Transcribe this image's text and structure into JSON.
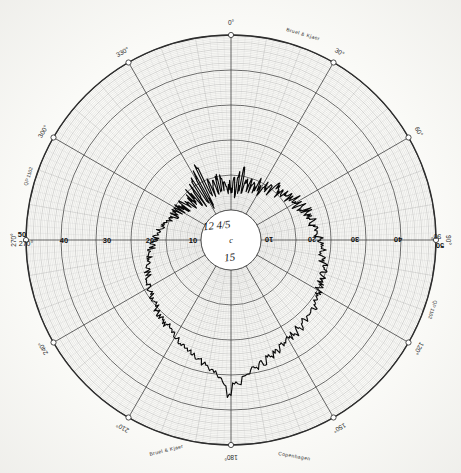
{
  "document": {
    "kind": "polar-recording-chart",
    "brand_top": "Bruel & Kjaer",
    "brand_bottom": "Bruel & Kjaer",
    "brand_bottom_right": "Copenhagen",
    "paper_code_left": "QP 1102",
    "paper_code_right": "QP 1102"
  },
  "annotations": {
    "center_top": "12  4/5",
    "center_mid": "c",
    "center_bottom": "15"
  },
  "axis": {
    "radial_unit": "dB",
    "left_labels": [
      "50",
      "40",
      "30",
      "20",
      "10",
      "0"
    ],
    "right_labels": [
      "0",
      "10",
      "20",
      "30",
      "40",
      "50"
    ],
    "left_origin_angle_label": "270°",
    "right_origin_angle_label": "90°",
    "db_range": [
      0,
      50
    ],
    "db_major_step": 10,
    "db_minor_step": 2
  },
  "angles": {
    "labels": [
      "0°",
      "30°",
      "60°",
      "90°",
      "120°",
      "150°",
      "180°",
      "210°",
      "240°",
      "270°",
      "300°",
      "330°"
    ],
    "step_deg": 30,
    "minor_step_deg": 10
  },
  "chart_data": {
    "type": "line",
    "subtype": "polar-directivity-pattern",
    "xlabel": "Angle (degrees)",
    "ylabel": "Level (dB)",
    "rlim": [
      0,
      50
    ],
    "r_direction": "inward-decreasing",
    "grid": true,
    "legend": "none",
    "theta_unit": "degrees",
    "theta_zero_location": "N",
    "theta_direction": "clockwise",
    "series": [
      {
        "name": "recorded level",
        "theta": [
          0,
          2,
          4,
          6,
          8,
          10,
          12,
          14,
          16,
          18,
          20,
          22,
          24,
          26,
          28,
          30,
          32,
          34,
          36,
          38,
          40,
          42,
          44,
          46,
          48,
          50,
          52,
          54,
          56,
          58,
          60,
          62,
          64,
          66,
          68,
          70,
          72,
          74,
          76,
          78,
          80,
          82,
          84,
          86,
          88,
          90,
          92,
          94,
          96,
          98,
          100,
          102,
          104,
          106,
          108,
          110,
          112,
          114,
          116,
          118,
          120,
          122,
          124,
          126,
          128,
          130,
          132,
          134,
          136,
          138,
          140,
          142,
          144,
          146,
          148,
          150,
          152,
          154,
          156,
          158,
          160,
          162,
          164,
          166,
          168,
          170,
          172,
          174,
          176,
          178,
          180,
          182,
          184,
          186,
          188,
          190,
          192,
          194,
          196,
          198,
          200,
          202,
          204,
          206,
          208,
          210,
          212,
          214,
          216,
          218,
          220,
          222,
          224,
          226,
          228,
          230,
          232,
          234,
          236,
          238,
          240,
          242,
          244,
          246,
          248,
          250,
          252,
          254,
          256,
          258,
          260,
          262,
          264,
          266,
          268,
          270,
          272,
          274,
          276,
          278,
          280,
          282,
          284,
          286,
          288,
          290,
          292,
          294,
          296,
          298,
          300,
          302,
          304,
          306,
          308,
          310,
          312,
          314,
          316,
          318,
          320,
          322,
          324,
          326,
          328,
          330,
          332,
          334,
          336,
          338,
          340,
          342,
          344,
          346,
          348,
          350,
          352,
          354,
          356,
          358
        ],
        "r_db": [
          44.5,
          40.0,
          45.0,
          39.5,
          44.0,
          38.5,
          43.5,
          41.0,
          42.5,
          40.5,
          43.0,
          41.5,
          42.0,
          40.0,
          41.5,
          42.5,
          40.5,
          41.0,
          39.5,
          40.5,
          38.5,
          39.5,
          40.0,
          38.0,
          39.0,
          38.5,
          37.5,
          38.0,
          37.0,
          37.5,
          36.5,
          37.0,
          36.0,
          36.5,
          35.5,
          36.0,
          35.0,
          35.5,
          34.5,
          35.0,
          34.0,
          34.5,
          33.5,
          34.0,
          33.0,
          33.5,
          32.5,
          33.0,
          32.0,
          32.5,
          31.5,
          32.0,
          31.0,
          31.5,
          30.5,
          31.0,
          30.0,
          30.5,
          29.5,
          30.0,
          29.0,
          29.5,
          28.5,
          29.0,
          28.0,
          28.5,
          27.5,
          28.0,
          27.0,
          27.5,
          26.5,
          27.0,
          26.0,
          26.5,
          25.5,
          26.0,
          25.0,
          25.5,
          24.0,
          24.5,
          23.0,
          23.5,
          22.0,
          22.5,
          21.0,
          21.5,
          19.5,
          20.0,
          17.5,
          18.0,
          14.0,
          17.5,
          19.0,
          20.5,
          21.0,
          22.0,
          22.5,
          23.0,
          23.5,
          24.0,
          24.5,
          25.0,
          25.5,
          26.0,
          26.5,
          27.0,
          27.0,
          27.5,
          28.0,
          28.0,
          28.5,
          29.0,
          29.0,
          29.5,
          30.0,
          30.0,
          30.5,
          31.0,
          31.0,
          31.5,
          32.0,
          32.0,
          32.5,
          33.0,
          33.0,
          33.5,
          34.0,
          34.0,
          34.5,
          35.0,
          35.0,
          35.5,
          36.0,
          36.0,
          36.5,
          37.0,
          37.0,
          37.5,
          38.0,
          38.0,
          38.5,
          39.0,
          39.0,
          39.5,
          40.0,
          40.0,
          40.5,
          41.0,
          41.0,
          41.5,
          42.0,
          41.5,
          42.5,
          41.0,
          43.0,
          41.5,
          43.5,
          42.0,
          44.0,
          41.0,
          44.5,
          40.5,
          45.0,
          39.0,
          46.0,
          38.0,
          47.0,
          36.5,
          45.5,
          39.5,
          44.0,
          41.0,
          43.5,
          40.5,
          44.0,
          41.5,
          43.0,
          42.0,
          44.0,
          43.0
        ],
        "note": "jagged hand-recorded trace; sharp peaks and deep notches near 0°, deep null near 180°"
      }
    ]
  }
}
